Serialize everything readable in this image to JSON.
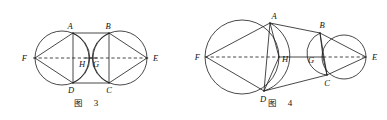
{
  "page": {
    "width": 387,
    "height": 120,
    "background": "#ffffff",
    "ink": "#1a1a1a"
  },
  "figures": [
    {
      "id": "figure-3",
      "caption_cjk": "图",
      "caption_number": "3",
      "caption_x": 78,
      "caption_y": 104,
      "caption_num_x": 95,
      "description": "Two equal circles side by side with rectangle ABCD inscribed between them; F is the left apex, E the right apex, H and G the inner intersection points on the dashed axis FE.",
      "axis": {
        "x1": 27,
        "y1": 58,
        "x2": 155,
        "y2": 58
      },
      "circles": [
        {
          "name": "left-circle",
          "cx": 62,
          "cy": 58,
          "r": 27
        },
        {
          "name": "right-circle",
          "cx": 120,
          "cy": 58,
          "r": 27
        }
      ],
      "points": [
        {
          "id": "A",
          "x": 73,
          "y": 33,
          "lx": 70,
          "ly": 29
        },
        {
          "id": "B",
          "x": 109,
          "y": 33,
          "lx": 108,
          "ly": 29
        },
        {
          "id": "C",
          "x": 109,
          "y": 83,
          "lx": 108,
          "ly": 91
        },
        {
          "id": "D",
          "x": 73,
          "y": 83,
          "lx": 69,
          "ly": 91
        },
        {
          "id": "E",
          "x": 147,
          "y": 58,
          "lx": 151,
          "ly": 61
        },
        {
          "id": "F",
          "x": 35,
          "y": 58,
          "lx": 24,
          "ly": 61
        },
        {
          "id": "H",
          "x": 85,
          "y": 58,
          "lx": 79,
          "ly": 66
        },
        {
          "id": "G",
          "x": 96,
          "y": 58,
          "lx": 93,
          "ly": 66
        }
      ],
      "segments": [
        {
          "from": "A",
          "to": "B"
        },
        {
          "from": "D",
          "to": "C"
        },
        {
          "from": "A",
          "to": "D"
        },
        {
          "from": "B",
          "to": "C"
        },
        {
          "from": "F",
          "to": "A"
        },
        {
          "from": "F",
          "to": "D"
        },
        {
          "from": "E",
          "to": "B"
        },
        {
          "from": "E",
          "to": "C"
        },
        {
          "from": "H",
          "to": "G"
        }
      ],
      "arcs": [
        {
          "name": "arc-A-H-D",
          "from": "A",
          "to": "D",
          "bulge": "right"
        },
        {
          "name": "arc-B-G-C",
          "from": "B",
          "to": "C",
          "bulge": "left"
        }
      ]
    },
    {
      "id": "figure-4",
      "caption_cjk": "图",
      "caption_number": "4",
      "caption_x": 272,
      "caption_y": 104,
      "caption_num_x": 289,
      "description": "A large circle on the left and a smaller circle on the right, joined by segments AB and DC; F is the left apex, E the right apex, H and G lie on the dashed axis FE.",
      "axis": {
        "x1": 203,
        "y1": 57,
        "x2": 372,
        "y2": 57
      },
      "circles": [
        {
          "name": "large-left-circle",
          "cx": 242,
          "cy": 57,
          "r": 37
        },
        {
          "name": "small-right-circle",
          "cx": 344,
          "cy": 57,
          "r": 22
        }
      ],
      "points": [
        {
          "id": "A",
          "x": 270,
          "y": 23,
          "lx": 272,
          "ly": 19
        },
        {
          "id": "B",
          "x": 320,
          "y": 33,
          "lx": 321,
          "ly": 28
        },
        {
          "id": "C",
          "x": 327,
          "y": 75,
          "lx": 325,
          "ly": 84
        },
        {
          "id": "D",
          "x": 264,
          "y": 91,
          "lx": 261,
          "ly": 99
        },
        {
          "id": "E",
          "x": 366,
          "y": 57,
          "lx": 371,
          "ly": 60
        },
        {
          "id": "F",
          "x": 206,
          "y": 57,
          "lx": 197,
          "ly": 60
        },
        {
          "id": "H",
          "x": 279,
          "y": 57,
          "lx": 283,
          "ly": 63
        },
        {
          "id": "G",
          "x": 323,
          "y": 57,
          "lx": 310,
          "ly": 63
        }
      ],
      "segments": [
        {
          "from": "A",
          "to": "B"
        },
        {
          "from": "D",
          "to": "C"
        },
        {
          "from": "A",
          "to": "D"
        },
        {
          "from": "B",
          "to": "C"
        },
        {
          "from": "F",
          "to": "A"
        },
        {
          "from": "F",
          "to": "D"
        },
        {
          "from": "F",
          "to": "H"
        },
        {
          "from": "E",
          "to": "B"
        },
        {
          "from": "E",
          "to": "C"
        },
        {
          "from": "A",
          "to": "H"
        },
        {
          "from": "D",
          "to": "H"
        },
        {
          "from": "B",
          "to": "G"
        },
        {
          "from": "C",
          "to": "G"
        },
        {
          "from": "H",
          "to": "G"
        }
      ],
      "arcs": [
        {
          "name": "arc-A-H-D",
          "from": "A",
          "to": "D",
          "bulge": "right"
        },
        {
          "name": "arc-B-G-C",
          "from": "B",
          "to": "C",
          "bulge": "left"
        }
      ]
    }
  ]
}
